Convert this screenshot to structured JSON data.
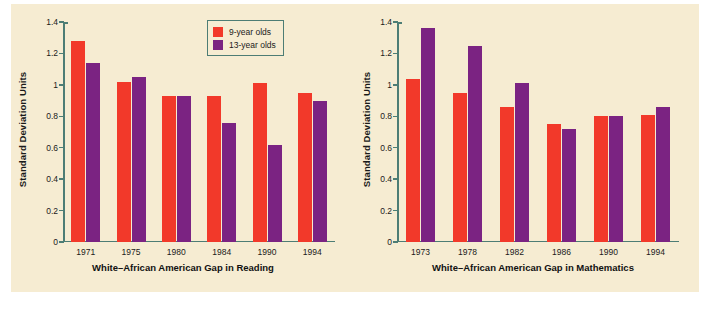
{
  "figure": {
    "background_color": "#ffffff",
    "panel_color": "#f6ecd2"
  },
  "legend": {
    "position": "top-center-left-chart",
    "border_color": "#4d7d75",
    "entries": [
      {
        "label": "9-year olds",
        "color": "#f2392a",
        "key": "age9"
      },
      {
        "label": "13-year olds",
        "color": "#7b2382",
        "key": "age13"
      }
    ]
  },
  "axis": {
    "ylabel": "Standard Deviation Units",
    "tick_labels": [
      "0",
      "0.2",
      "0.4",
      "0.6",
      "0.8",
      "1",
      "1.2",
      "1.4"
    ],
    "tick_values": [
      0,
      0.2,
      0.4,
      0.6,
      0.8,
      1,
      1.2,
      1.4
    ],
    "ymin": 0,
    "ymax": 1.4,
    "axis_color": "#4d7d75"
  },
  "chart_data": [
    {
      "type": "bar",
      "id": "reading",
      "title": "White–African American Gap in Reading",
      "xlabel": "White–African American Gap in Reading",
      "ylabel": "Standard Deviation Units",
      "ylim": [
        0,
        1.4
      ],
      "yticks": [
        0,
        0.2,
        0.4,
        0.6,
        0.8,
        1,
        1.2,
        1.4
      ],
      "grid": false,
      "legend": "top-center",
      "categories": [
        "1971",
        "1975",
        "1980",
        "1984",
        "1990",
        "1994"
      ],
      "series": [
        {
          "name": "9-year olds",
          "color": "#f2392a",
          "values": [
            1.28,
            1.02,
            0.93,
            0.93,
            1.01,
            0.95
          ]
        },
        {
          "name": "13-year olds",
          "color": "#7b2382",
          "values": [
            1.14,
            1.05,
            0.93,
            0.76,
            0.62,
            0.9
          ]
        }
      ]
    },
    {
      "type": "bar",
      "id": "mathematics",
      "title": "White–African American Gap in Mathematics",
      "xlabel": "White–African American Gap in Mathematics",
      "ylabel": "Standard Deviation Units",
      "ylim": [
        0,
        1.4
      ],
      "yticks": [
        0,
        0.2,
        0.4,
        0.6,
        0.8,
        1,
        1.2,
        1.4
      ],
      "grid": false,
      "legend": "none",
      "categories": [
        "1973",
        "1978",
        "1982",
        "1986",
        "1990",
        "1994"
      ],
      "series": [
        {
          "name": "9-year olds",
          "color": "#f2392a",
          "values": [
            1.04,
            0.95,
            0.86,
            0.75,
            0.8,
            0.81
          ]
        },
        {
          "name": "13-year olds",
          "color": "#7b2382",
          "values": [
            1.36,
            1.25,
            1.01,
            0.72,
            0.8,
            0.86
          ]
        }
      ]
    }
  ]
}
